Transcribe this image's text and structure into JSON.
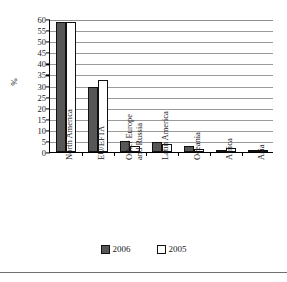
{
  "chart_data": {
    "type": "bar",
    "title": "",
    "subtitle": "",
    "xlabel": "",
    "ylabel": "%",
    "ylim": [
      0,
      60
    ],
    "ytick_step": 5,
    "yticks": [
      "0",
      "5",
      "10",
      "15",
      "20",
      "25",
      "30",
      "35",
      "40",
      "45",
      "50",
      "55",
      "60"
    ],
    "grid": true,
    "legend_position": "bottom-center",
    "categories": [
      "North America",
      "EU/EFTA",
      "Other Europe and Russia",
      "Latin America",
      "Oceania",
      "Africa",
      "Asia"
    ],
    "category_label_lines": [
      [
        "North America"
      ],
      [
        "EU/EFTA"
      ],
      [
        "Other Europe",
        "and Russia"
      ],
      [
        "Latin America"
      ],
      [
        "Oceania"
      ],
      [
        "Africa"
      ],
      [
        "Asia"
      ]
    ],
    "series": [
      {
        "name": "2006",
        "color": "#575757",
        "values": [
          58.5,
          29.5,
          5.0,
          4.3,
          2.5,
          0.8,
          0.3
        ]
      },
      {
        "name": "2005",
        "color": "#ffffff",
        "values": [
          58.5,
          32.5,
          2.5,
          3.7,
          1.2,
          1.6,
          0.3
        ]
      }
    ]
  },
  "legend": {
    "items": [
      {
        "label": "2006",
        "swatch": "filled-dark-square"
      },
      {
        "label": "2005",
        "swatch": "empty-white-square"
      }
    ]
  },
  "axis": {
    "y_title": "%"
  }
}
